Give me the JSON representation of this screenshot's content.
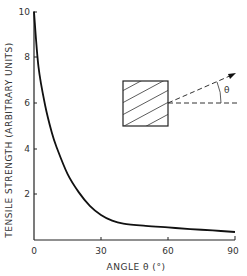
{
  "chart_data": {
    "type": "line",
    "title": "",
    "xlabel": "ANGLE θ (°)",
    "ylabel": "TENSILE STRENGTH (ARBITRARY UNITS)",
    "xlim": [
      0,
      90
    ],
    "ylim": [
      0,
      10
    ],
    "x_ticks": [
      "0",
      "30",
      "60",
      "90"
    ],
    "y_ticks": [
      "2",
      "4",
      "6",
      "8",
      "10"
    ],
    "grid": false,
    "legend": null,
    "series": [
      {
        "name": "Tensile strength vs fibre angle",
        "x": [
          0,
          2,
          5,
          8,
          10,
          15,
          20,
          25,
          30,
          35,
          40,
          50,
          60,
          70,
          80,
          90
        ],
        "y": [
          10,
          7.6,
          5.9,
          4.7,
          4.1,
          2.9,
          2.1,
          1.5,
          1.1,
          0.85,
          0.72,
          0.62,
          0.55,
          0.48,
          0.42,
          0.35
        ]
      }
    ],
    "annotations": [
      {
        "type": "inset-diagram",
        "description": "Hatched square (fibre-reinforced specimen) with dashed horizontal reference line and dashed arrow at angle θ",
        "label": "θ"
      }
    ]
  },
  "axes": {
    "x_title": "ANGLE θ (°)",
    "y_title": "TENSILE STRENGTH (ARBITRARY UNITS)",
    "x_ticks": [
      "0",
      "30",
      "60",
      "90"
    ],
    "y_ticks": [
      "2",
      "4",
      "6",
      "8",
      "10"
    ],
    "origin_label": "0"
  },
  "inset": {
    "angle_label": "θ"
  }
}
